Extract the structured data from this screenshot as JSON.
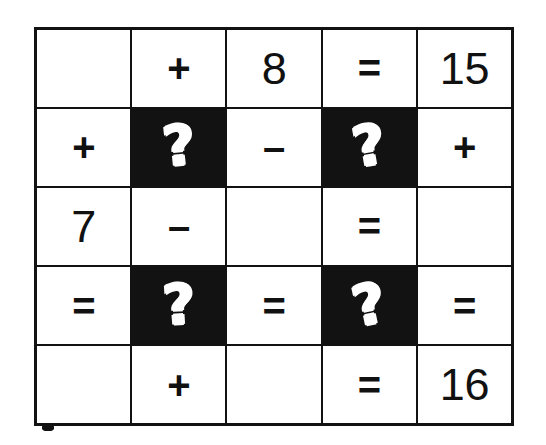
{
  "puzzle": {
    "title": "Math Puzzle Grid",
    "type": "cross-number-grid",
    "rows": 5,
    "cols": 5,
    "colors": {
      "ink": "#121212",
      "paper": "#ffffff",
      "unknown_cell_background": "#121212",
      "unknown_cell_text": "#ffffff"
    },
    "unknown_symbol": "?",
    "grid": [
      [
        {
          "text": "",
          "kind": "empty",
          "black": false
        },
        {
          "text": "+",
          "kind": "operator",
          "black": false
        },
        {
          "text": "8",
          "kind": "number",
          "black": false
        },
        {
          "text": "=",
          "kind": "operator",
          "black": false
        },
        {
          "text": "15",
          "kind": "number",
          "black": false
        }
      ],
      [
        {
          "text": "+",
          "kind": "operator",
          "black": false
        },
        {
          "text": "?",
          "kind": "unknown",
          "black": true
        },
        {
          "text": "–",
          "kind": "operator",
          "black": false
        },
        {
          "text": "?",
          "kind": "unknown",
          "black": true
        },
        {
          "text": "+",
          "kind": "operator",
          "black": false
        }
      ],
      [
        {
          "text": "7",
          "kind": "number",
          "black": false
        },
        {
          "text": "–",
          "kind": "operator",
          "black": false
        },
        {
          "text": "",
          "kind": "empty",
          "black": false
        },
        {
          "text": "=",
          "kind": "operator",
          "black": false
        },
        {
          "text": "",
          "kind": "empty",
          "black": false
        }
      ],
      [
        {
          "text": "=",
          "kind": "operator",
          "black": false
        },
        {
          "text": "?",
          "kind": "unknown",
          "black": true
        },
        {
          "text": "=",
          "kind": "operator",
          "black": false
        },
        {
          "text": "?",
          "kind": "unknown",
          "black": true
        },
        {
          "text": "=",
          "kind": "operator",
          "black": false
        }
      ],
      [
        {
          "text": "",
          "kind": "empty",
          "black": false
        },
        {
          "text": "+",
          "kind": "operator",
          "black": false
        },
        {
          "text": "",
          "kind": "empty",
          "black": false
        },
        {
          "text": "=",
          "kind": "operator",
          "black": false
        },
        {
          "text": "16",
          "kind": "number",
          "black": false
        }
      ]
    ]
  }
}
